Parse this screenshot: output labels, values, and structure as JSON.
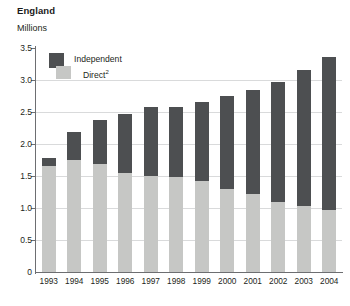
{
  "header": {
    "title": "England",
    "subtitle": "Millions"
  },
  "legend": {
    "items": [
      {
        "label": "Independent",
        "color": "#4d4f51"
      },
      {
        "label": "Direct",
        "note": "2",
        "color": "#c6c7c5"
      }
    ]
  },
  "axes": {
    "y_ticks": [
      "0",
      "0.5",
      "1.0",
      "1.5",
      "2.0",
      "2.5",
      "3.0",
      "3.5"
    ],
    "x_ticks": [
      "1993",
      "1994",
      "1995",
      "1996",
      "1997",
      "1998",
      "1999",
      "2000",
      "2001",
      "2002",
      "2003",
      "2004"
    ]
  },
  "chart_data": {
    "type": "bar",
    "title": "England",
    "subtitle": "Millions",
    "xlabel": "",
    "ylabel": "Millions",
    "ylim": [
      0,
      3.5
    ],
    "ytick_step": 0.5,
    "grid": true,
    "stacked": true,
    "legend_position": "top-left-inside",
    "categories": [
      "1993",
      "1994",
      "1995",
      "1996",
      "1997",
      "1998",
      "1999",
      "2000",
      "2001",
      "2002",
      "2003",
      "2004"
    ],
    "series": [
      {
        "name": "Direct",
        "color": "#c6c7c5",
        "values": [
          1.65,
          1.75,
          1.68,
          1.54,
          1.5,
          1.49,
          1.42,
          1.3,
          1.22,
          1.1,
          1.03,
          0.97
        ]
      },
      {
        "name": "Independent",
        "color": "#4d4f51",
        "values": [
          0.13,
          0.44,
          0.7,
          0.93,
          1.08,
          1.09,
          1.23,
          1.45,
          1.63,
          1.87,
          2.12,
          2.39
        ]
      }
    ],
    "totals": [
      1.78,
      2.19,
      2.38,
      2.47,
      2.58,
      2.58,
      2.65,
      2.75,
      2.85,
      2.97,
      3.15,
      3.36
    ]
  }
}
